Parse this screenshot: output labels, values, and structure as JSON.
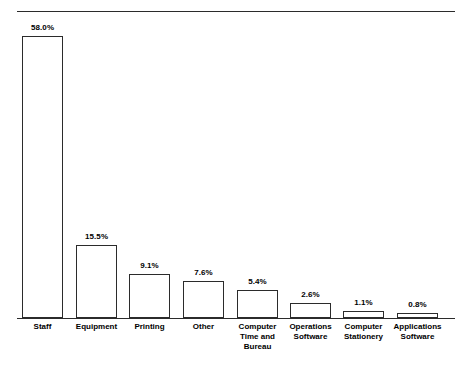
{
  "chart_data": {
    "type": "bar",
    "title": "",
    "subtitle": "",
    "xlabel": "",
    "ylabel": "",
    "ylim": [
      0,
      58.0
    ],
    "grid": false,
    "legend": "none",
    "axis_line": "baseline only",
    "units": "percent",
    "categories": [
      "Staff",
      "Equipment",
      "Printing",
      "Other",
      "Computer Time and Bureau",
      "Operations Software",
      "Computer Stationery",
      "Applications Software"
    ],
    "category_label_lines": [
      [
        "Staff"
      ],
      [
        "Equipment"
      ],
      [
        "Printing"
      ],
      [
        "Other"
      ],
      [
        "Computer",
        "Time and",
        "Bureau"
      ],
      [
        "Operations",
        "Software"
      ],
      [
        "Computer",
        "Stationery"
      ],
      [
        "Applications",
        "Software"
      ]
    ],
    "values": [
      58.0,
      15.5,
      9.1,
      7.6,
      5.4,
      2.6,
      1.1,
      0.8
    ],
    "data_labels": [
      "58.0%",
      "15.5%",
      "9.1%",
      "7.6%",
      "5.4%",
      "2.6%",
      "1.1%",
      "0.8%"
    ]
  },
  "style": {
    "bar_fill": "#ffffff",
    "bar_stroke": "#2b2b2b",
    "text_color": "#000000",
    "background": "#ffffff"
  },
  "geometry": {
    "baseline_y": 318,
    "bar_width": 41,
    "bar_left_positions": [
      22,
      76,
      129,
      183,
      237,
      290,
      343,
      397
    ],
    "bar_tops": [
      36,
      245,
      274,
      281,
      290,
      303,
      311,
      313
    ],
    "label_tops": [
      23,
      232,
      261,
      268,
      277,
      290,
      298,
      300
    ]
  }
}
